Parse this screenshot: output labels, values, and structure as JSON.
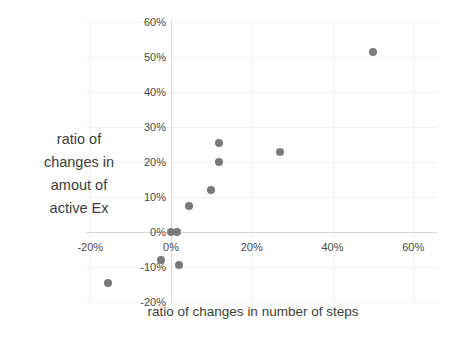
{
  "chart_data": {
    "type": "scatter",
    "title": "",
    "xlabel": "ratio of changes in number of steps",
    "ylabel_lines": [
      "ratio of",
      "changes in",
      "amout of",
      "active Ex"
    ],
    "x_ticks": [
      {
        "value": -20,
        "label": "-20%"
      },
      {
        "value": 0,
        "label": "0%"
      },
      {
        "value": 20,
        "label": "20%"
      },
      {
        "value": 40,
        "label": "40%"
      },
      {
        "value": 60,
        "label": "60%"
      }
    ],
    "y_ticks": [
      {
        "value": 60,
        "label": "60%"
      },
      {
        "value": 50,
        "label": "50%"
      },
      {
        "value": 40,
        "label": "40%"
      },
      {
        "value": 30,
        "label": "30%"
      },
      {
        "value": 20,
        "label": "20%"
      },
      {
        "value": 10,
        "label": "10%"
      },
      {
        "value": 0,
        "label": "0%"
      },
      {
        "value": -10,
        "label": "-10%"
      },
      {
        "value": -20,
        "label": "-20%"
      }
    ],
    "xlim": [
      -25,
      66
    ],
    "ylim": [
      -22.5,
      62
    ],
    "grid": true,
    "legend_position": "none",
    "units": "percent",
    "points": [
      {
        "x": -15.5,
        "y": -14.5
      },
      {
        "x": -2.5,
        "y": -8
      },
      {
        "x": 0,
        "y": 0
      },
      {
        "x": 1.5,
        "y": 0
      },
      {
        "x": 2,
        "y": -9.5
      },
      {
        "x": 4.5,
        "y": 7.5
      },
      {
        "x": 10,
        "y": 12
      },
      {
        "x": 12,
        "y": 20
      },
      {
        "x": 12,
        "y": 25.5
      },
      {
        "x": 27,
        "y": 23
      },
      {
        "x": 50,
        "y": 51.5
      }
    ],
    "colors": {
      "point": "#7a7a7a",
      "gridline": "#f2f2f2",
      "axis_line": "#d9d9d9",
      "tick_label": "#4a4a4a",
      "axis_title": "#3d3d3d",
      "background": "#ffffff"
    }
  }
}
